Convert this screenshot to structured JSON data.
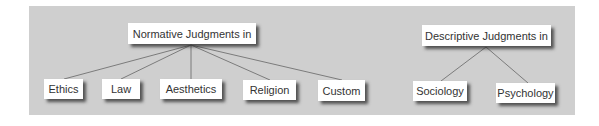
{
  "diagram": {
    "colors": {
      "panel": "#cfcfcf",
      "node": "#ffffff",
      "line": "#666666",
      "text": "#333333"
    },
    "groups": [
      {
        "title": "Normative Judgments in",
        "children": [
          "Ethics",
          "Law",
          "Aesthetics",
          "Religion",
          "Custom"
        ]
      },
      {
        "title": "Descriptive Judgments in",
        "children": [
          "Sociology",
          "Psychology"
        ]
      }
    ]
  }
}
